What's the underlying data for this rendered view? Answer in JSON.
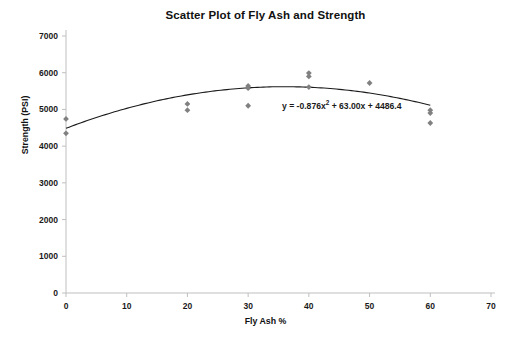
{
  "chart_data": {
    "type": "scatter",
    "title": "Scatter Plot of Fly Ash and Strength",
    "xlabel": "Fly Ash %",
    "ylabel": "Strength (PSI)",
    "xlim": [
      0,
      70
    ],
    "ylim": [
      0,
      7000
    ],
    "xticks": [
      "0",
      "10",
      "20",
      "30",
      "40",
      "50",
      "60",
      "70"
    ],
    "yticks": [
      "0",
      "1000",
      "2000",
      "3000",
      "4000",
      "5000",
      "6000",
      "7000"
    ],
    "grid": false,
    "legend": "none",
    "marker_color": "#808080",
    "marker_shape": "diamond",
    "trendline_color": "#1a1a1a",
    "axis_color": "#bfbfbf",
    "points": [
      {
        "x": 0,
        "y": 4740
      },
      {
        "x": 0,
        "y": 4350
      },
      {
        "x": 20,
        "y": 5150
      },
      {
        "x": 20,
        "y": 4980
      },
      {
        "x": 30,
        "y": 5640
      },
      {
        "x": 30,
        "y": 5580
      },
      {
        "x": 30,
        "y": 5100
      },
      {
        "x": 40,
        "y": 5990
      },
      {
        "x": 40,
        "y": 5900
      },
      {
        "x": 40,
        "y": 5610
      },
      {
        "x": 50,
        "y": 5720
      },
      {
        "x": 60,
        "y": 4980
      },
      {
        "x": 60,
        "y": 4900
      },
      {
        "x": 60,
        "y": 4630
      }
    ],
    "trendline": {
      "type": "polynomial",
      "degree": 2,
      "equation": "y = -0.876x² + 63.00x + 4486.4",
      "equation_prefix": "y = -0.876x",
      "equation_exponent": "2",
      "equation_suffix": " + 63.00x + 4486.4",
      "a": -0.876,
      "b": 63.0,
      "c": 4486.4,
      "x_start": 0,
      "x_end": 60
    }
  }
}
